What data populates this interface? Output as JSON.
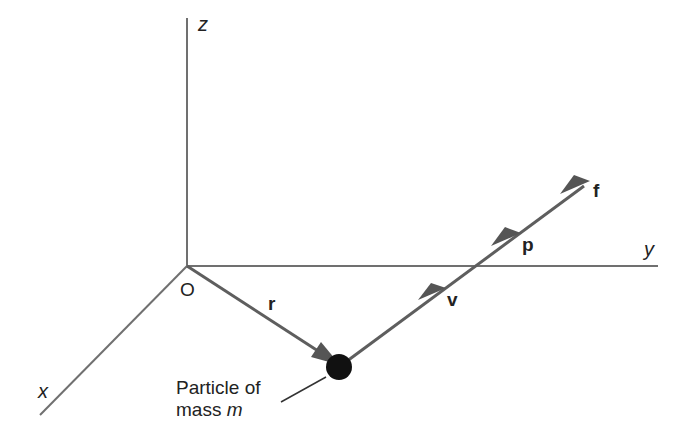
{
  "diagram": {
    "axes": {
      "z_label": "z",
      "y_label": "y",
      "x_label": "x",
      "origin_label": "O"
    },
    "vectors": {
      "r": "r",
      "v": "v",
      "p": "p",
      "f": "f"
    },
    "particle": {
      "caption_line1": "Particle of",
      "caption_line2_prefix": "mass ",
      "caption_line2_symbol": "m"
    },
    "colors": {
      "axis": "#707070",
      "vector": "#5e5e5e",
      "arrowhead": "#555555",
      "particle": "#111111",
      "text": "#222222"
    }
  }
}
